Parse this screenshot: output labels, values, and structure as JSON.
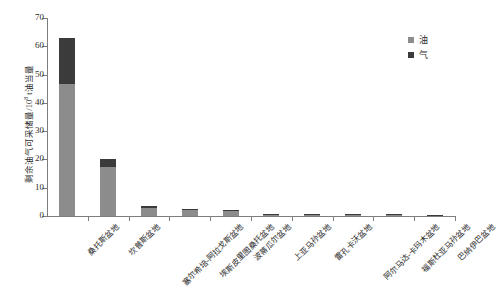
{
  "chart_data": {
    "type": "bar",
    "subtype": "stacked-vertical",
    "title": "",
    "xlabel": "",
    "ylabel": "剩余油气可采储量/10⁸ t油当量",
    "ylabel_parts": {
      "prefix": "剩余油气可采储量/10",
      "exponent": "8",
      "suffix": " t油当量"
    },
    "ylim": [
      0,
      70
    ],
    "yticks": [
      0,
      10,
      20,
      30,
      40,
      50,
      60,
      70
    ],
    "grid": false,
    "legend_position": "top-right",
    "categories": [
      "桑托斯盆地",
      "坎普斯盆地",
      "塞尔希培-阿拉戈斯盆地",
      "埃斯皮里图桑托盆地",
      "波蒂瓜尔盆地",
      "上亚马孙盆地",
      "雷孔卡沃盆地",
      "阿尔马达-卡玛木盆地",
      "福斯杜亚马孙盆地",
      "巴纳伊巴盆地"
    ],
    "series": [
      {
        "name": "油",
        "color": "#8c8c8c",
        "values": [
          46.5,
          17.5,
          3.0,
          2.3,
          1.9,
          0.5,
          0.35,
          0.25,
          0.2,
          0.0
        ]
      },
      {
        "name": "气",
        "color": "#3b3b3b",
        "values": [
          16.5,
          2.7,
          0.4,
          0.3,
          0.3,
          0.2,
          0.15,
          0.1,
          0.1,
          0.15
        ]
      }
    ],
    "totals": [
      63.0,
      20.2,
      3.4,
      2.6,
      2.2,
      0.7,
      0.5,
      0.35,
      0.3,
      0.15
    ]
  },
  "legend": {
    "items": [
      {
        "label": "油",
        "color": "#8c8c8c"
      },
      {
        "label": "气",
        "color": "#3b3b3b"
      }
    ]
  },
  "axis": {
    "y_tick_labels": [
      "70",
      "60",
      "50",
      "40",
      "30",
      "20",
      "10",
      "0"
    ]
  }
}
